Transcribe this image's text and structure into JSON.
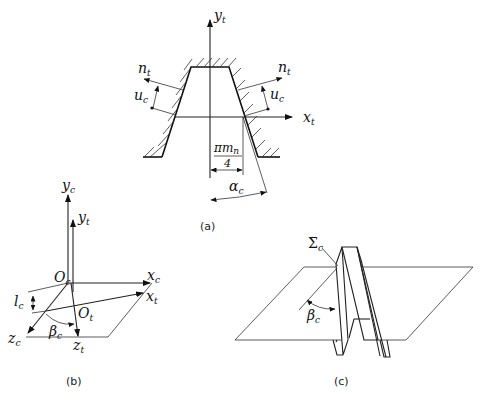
{
  "panels": {
    "a": {
      "caption": "(a)",
      "labels": {
        "y_axis": "y",
        "y_axis_sub": "t",
        "x_axis": "x",
        "x_axis_sub": "t",
        "normal_left": "n",
        "normal_left_sub": "t",
        "normal_right": "n",
        "normal_right_sub": "t",
        "offset_left": "u",
        "offset_left_sub": "c",
        "offset_right": "u",
        "offset_right_sub": "c",
        "half_width_num": "πm",
        "half_width_num_sub": "n",
        "half_width_den": "4",
        "angle": "α",
        "angle_sub": "c"
      }
    },
    "b": {
      "caption": "(b)",
      "labels": {
        "yc": "y",
        "yc_sub": "c",
        "yt": "y",
        "yt_sub": "t",
        "oc": "O",
        "oc_sub": "c",
        "ot": "O",
        "ot_sub": "t",
        "xc": "x",
        "xc_sub": "c",
        "xt": "x",
        "xt_sub": "t",
        "zc": "z",
        "zc_sub": "c",
        "zt": "z",
        "zt_sub": "t",
        "lc": "l",
        "lc_sub": "c",
        "beta": "β",
        "beta_sub": "c"
      }
    },
    "c": {
      "caption": "(c)",
      "labels": {
        "sigma": "Σ",
        "sigma_sub": "c",
        "beta": "β",
        "beta_sub": "c"
      }
    }
  }
}
